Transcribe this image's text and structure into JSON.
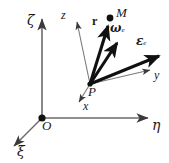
{
  "figure": {
    "kind": "3d-vector-diagram",
    "background": "#ffffff",
    "ink_color": "#1a1a1a",
    "thin_color": "#555555",
    "points": [
      {
        "name": "origin",
        "label": "O",
        "x": 42,
        "y": 118,
        "dot": true
      },
      {
        "name": "body-point",
        "label": "P",
        "x": 90,
        "y": 84,
        "dot": false
      },
      {
        "name": "mass-point",
        "label": "M",
        "x": 110,
        "y": 18,
        "dot": true
      }
    ],
    "global_axes": [
      {
        "name": "zeta-axis",
        "label": "ζ",
        "from": [
          42,
          118
        ],
        "to": [
          42,
          16
        ],
        "style": "thin",
        "label_pos": [
          29,
          16
        ]
      },
      {
        "name": "eta-axis",
        "label": "η",
        "from": [
          42,
          118
        ],
        "to": [
          152,
          118
        ],
        "style": "thin",
        "label_pos": [
          152,
          120
        ]
      },
      {
        "name": "xi-axis",
        "label": "ξ",
        "from": [
          42,
          118
        ],
        "to": [
          11,
          149
        ],
        "style": "thin",
        "label_pos": [
          17,
          146
        ]
      }
    ],
    "local_axes": [
      {
        "name": "z-axis",
        "label": "z",
        "from": [
          90,
          84
        ],
        "to": [
          76,
          18
        ],
        "style": "thin",
        "label_pos": [
          62,
          11
        ]
      },
      {
        "name": "x-axis",
        "label": "x",
        "from": [
          90,
          84
        ],
        "to": [
          78,
          106
        ],
        "style": "thin",
        "label_pos": [
          82,
          103
        ]
      },
      {
        "name": "y-axis",
        "label": "y",
        "from": [
          90,
          84
        ],
        "to": [
          155,
          69
        ],
        "style": "thin",
        "label_pos": [
          154,
          70
        ]
      }
    ],
    "vectors": [
      {
        "name": "position-vector-r",
        "label": "r",
        "from": [
          90,
          84
        ],
        "to": [
          109,
          21
        ],
        "style": "bold",
        "label_pos": [
          93,
          17
        ],
        "label_class": "bold"
      },
      {
        "name": "angular-velocity-omega-e",
        "label": "ω",
        "sub": "e",
        "from": [
          90,
          84
        ],
        "to": [
          120,
          39
        ],
        "style": "bold",
        "label_pos": [
          112,
          25
        ],
        "label_class": "boldgreek"
      },
      {
        "name": "angular-acceleration-epsilon-e",
        "label": "ε",
        "sub": "e",
        "from": [
          90,
          84
        ],
        "to": [
          163,
          54
        ],
        "style": "bold",
        "label_pos": [
          138,
          38
        ],
        "label_class": "boldgreek"
      },
      {
        "name": "extra-bold-vector",
        "label": "",
        "from": [
          90,
          84
        ],
        "to": [
          151,
          68
        ],
        "style": "bold-thin",
        "label_pos": [
          0,
          0
        ],
        "label_class": ""
      }
    ],
    "labels": {
      "O": "O",
      "P": "P",
      "M": "M",
      "zeta": "ζ",
      "eta": "η",
      "xi": "ξ",
      "x": "x",
      "y": "y",
      "z": "z",
      "r": "r",
      "omega": "ω",
      "epsilon": "ε",
      "sub_e": "e"
    }
  }
}
